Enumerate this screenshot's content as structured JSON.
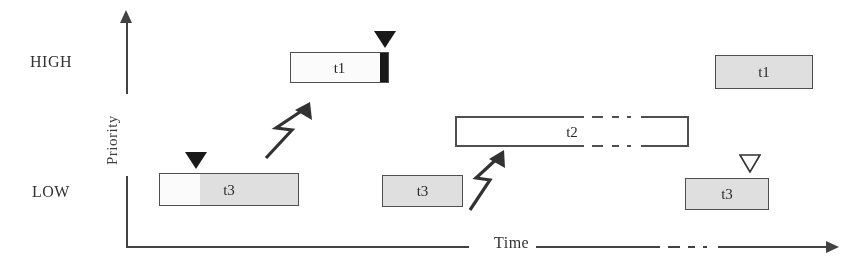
{
  "figure": {
    "type": "timing-diagram",
    "axes": {
      "y": {
        "label": "Priority",
        "ticks": [
          "HIGH",
          "LOW"
        ],
        "high_label": "HIGH",
        "low_label": "LOW",
        "arrow_direction": "up",
        "line_broken_for_label": true
      },
      "x": {
        "label": "Time",
        "arrow_direction": "right",
        "has_dash_dot_break": true,
        "ticks": []
      }
    },
    "colors": {
      "line": "#3c3c3c",
      "bar_border": "#4a4a4a",
      "bar_shaded_fill": "#e2e2e2",
      "bar_empty_fill": "#ffffff",
      "marker_filled": "#111111",
      "background": "#ffffff"
    },
    "legend_note": "",
    "bars": [
      {
        "id": "t1-first",
        "label": "t1",
        "priority_row": "HIGH",
        "fill": "empty",
        "has_black_end_segment": true
      },
      {
        "id": "t1-second",
        "label": "t1",
        "priority_row": "HIGH",
        "fill": "shaded",
        "has_black_end_segment": false
      },
      {
        "id": "t2",
        "label": "t2",
        "priority_row": "MIDDLE",
        "fill": "empty",
        "has_dash_dot_break": true
      },
      {
        "id": "t3-first",
        "label": "t3",
        "priority_row": "LOW",
        "fill": "partial-shaded",
        "has_black_end_segment": false
      },
      {
        "id": "t3-second",
        "label": "t3",
        "priority_row": "LOW",
        "fill": "shaded",
        "has_black_end_segment": false
      },
      {
        "id": "t3-third",
        "label": "t3",
        "priority_row": "LOW",
        "fill": "shaded",
        "has_black_end_segment": false
      }
    ],
    "markers": [
      {
        "id": "t1-release",
        "style": "filled-down-triangle",
        "row": "HIGH"
      },
      {
        "id": "t3-release",
        "style": "filled-down-triangle",
        "row": "LOW"
      },
      {
        "id": "t3-completion",
        "style": "hollow-down-triangle",
        "row": "LOW"
      }
    ],
    "arrows": [
      {
        "id": "preemption-1",
        "style": "lightning-bolt",
        "direction": "up-right"
      },
      {
        "id": "preemption-2",
        "style": "lightning-bolt",
        "direction": "up-right"
      }
    ]
  }
}
